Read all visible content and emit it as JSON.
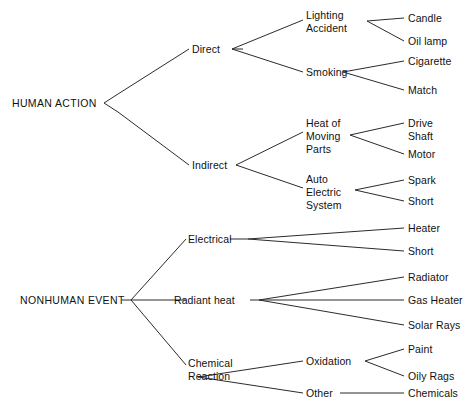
{
  "diagram": {
    "line_color": "#2b2b2b",
    "text_color": "#111111",
    "background": "#ffffff",
    "nodes": {
      "human_action": "HUMAN ACTION",
      "nonhuman_event": "NONHUMAN EVENT",
      "direct": "Direct",
      "indirect": "Indirect",
      "lighting_accident_line1": "Lighting",
      "lighting_accident_line2": "Accident",
      "smoking": "Smoking",
      "candle": "Candle",
      "oil_lamp": "Oil lamp",
      "cigarette": "Cigarette",
      "match": "Match",
      "heat_of_line1": "Heat of",
      "heat_of_line2": "Moving",
      "heat_of_line3": "Parts",
      "auto_electric_line1": "Auto",
      "auto_electric_line2": "Electric",
      "auto_electric_line3": "System",
      "drive_line1": "Drive",
      "drive_line2": "Shaft",
      "motor": "Motor",
      "spark": "Spark",
      "short_upper": "Short",
      "electrical": "Electrical",
      "radiant_heat": "Radiant heat",
      "chemical_line1": "Chemical",
      "chemical_line2": "Reaction",
      "heater": "Heater",
      "short_lower": "Short",
      "radiator": "Radiator",
      "gas_heater": "Gas Heater",
      "solar_rays": "Solar Rays",
      "oxidation": "Oxidation",
      "other": "Other",
      "paint": "Paint",
      "oily_rags": "Oily Rags",
      "chemicals": "Chemicals"
    }
  }
}
